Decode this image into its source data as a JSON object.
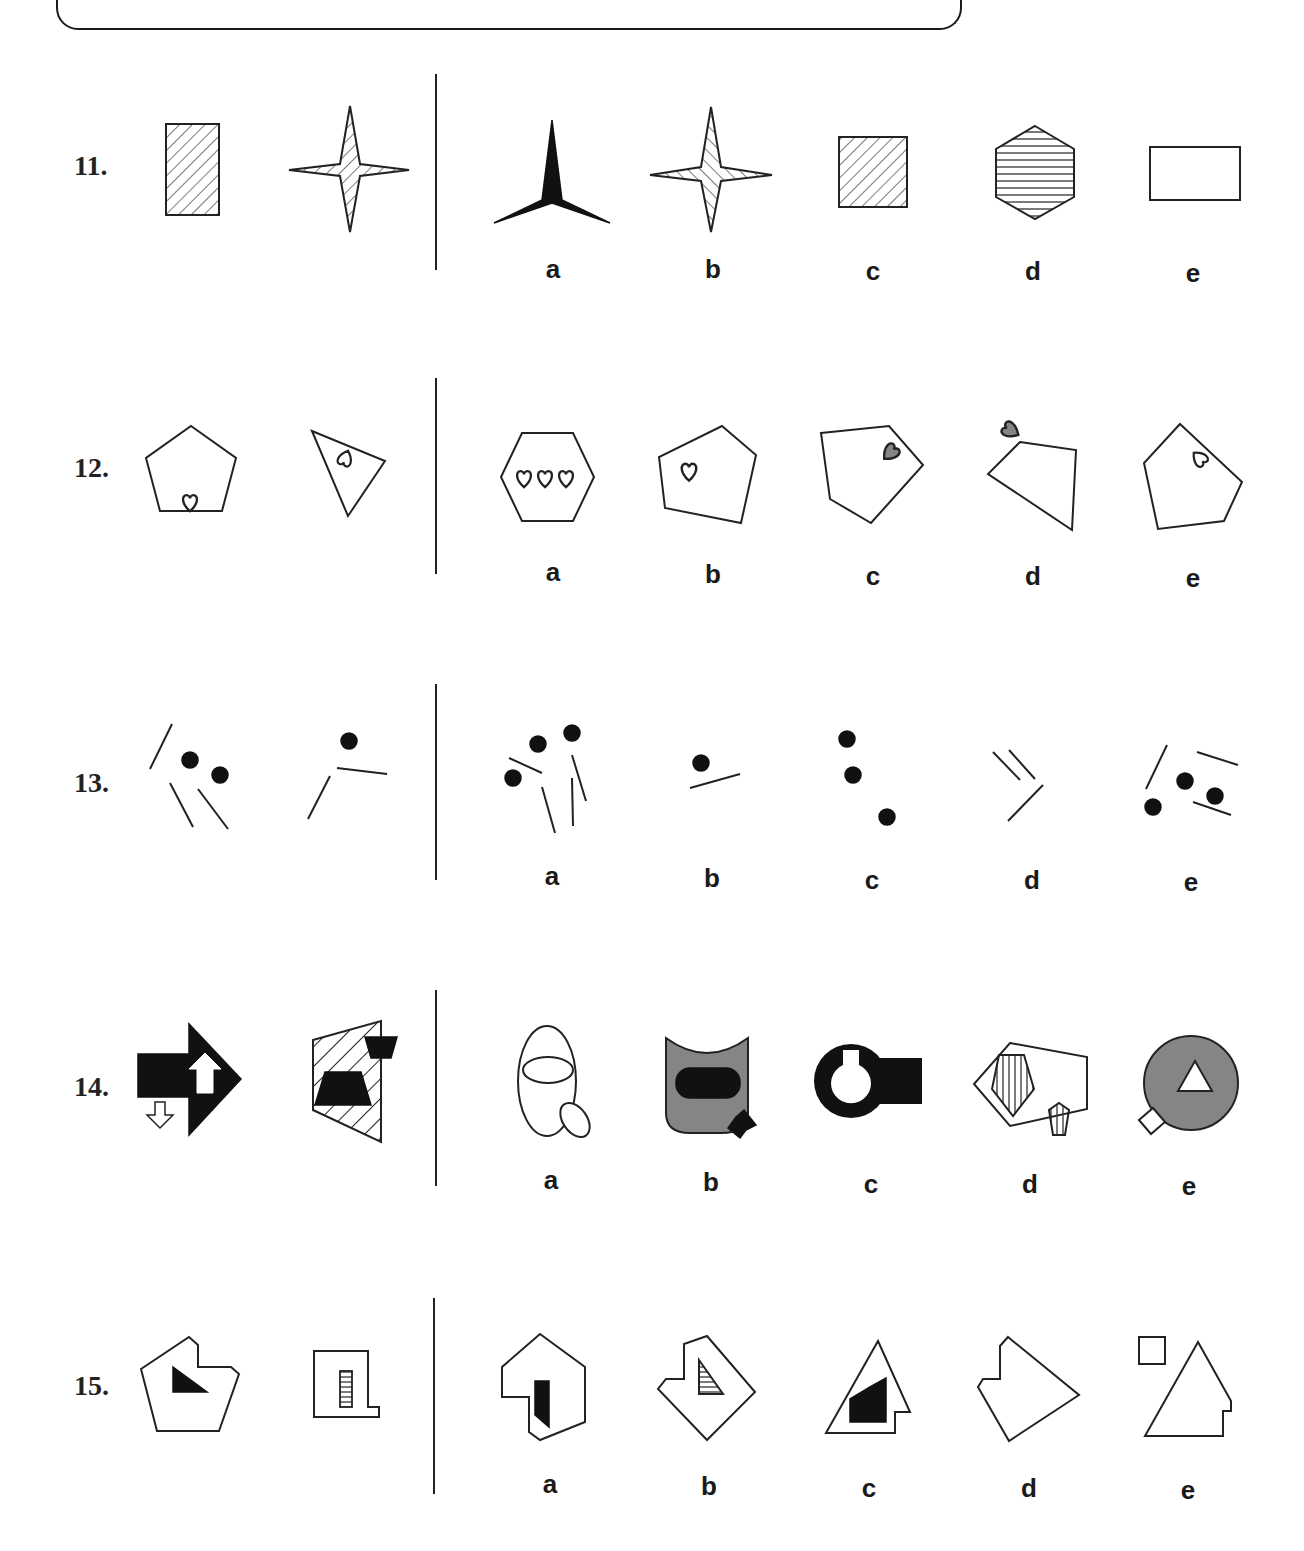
{
  "page": {
    "header_box": "rounded-bottom border panel (content cropped)"
  },
  "questions": [
    {
      "number": "11.",
      "given": [
        "hatched-rectangle",
        "hatched-four-point-star"
      ],
      "options": [
        {
          "label": "a",
          "figure": "black-three-point-star"
        },
        {
          "label": "b",
          "figure": "hatched-four-point-star"
        },
        {
          "label": "c",
          "figure": "hatched-square"
        },
        {
          "label": "d",
          "figure": "horizontal-striped-hexagon"
        },
        {
          "label": "e",
          "figure": "empty-rectangle"
        }
      ]
    },
    {
      "number": "12.",
      "given": [
        "pentagon-with-heart-on-edge",
        "triangle-with-heart-on-edge"
      ],
      "options": [
        {
          "label": "a",
          "figure": "hexagon-with-three-hearts"
        },
        {
          "label": "b",
          "figure": "pentagon-with-heart-inside"
        },
        {
          "label": "c",
          "figure": "pentagon-with-grey-heart-on-edge"
        },
        {
          "label": "d",
          "figure": "quadrilateral-with-grey-heart-outside"
        },
        {
          "label": "e",
          "figure": "pentagon-with-heart-on-edge"
        }
      ]
    },
    {
      "number": "13.",
      "given": [
        "three-lines-two-dots",
        "two-lines-one-dot"
      ],
      "options": [
        {
          "label": "a",
          "figure": "four-lines-three-dots"
        },
        {
          "label": "b",
          "figure": "one-line-one-dot"
        },
        {
          "label": "c",
          "figure": "three-dots"
        },
        {
          "label": "d",
          "figure": "three-lines"
        },
        {
          "label": "e",
          "figure": "three-lines-three-dots"
        }
      ]
    },
    {
      "number": "14.",
      "given": [
        "black-arrow-with-white-arrows",
        "hatched-quad-with-black-trapezoids"
      ],
      "options": [
        {
          "label": "a",
          "figure": "ellipse-with-ellipses"
        },
        {
          "label": "b",
          "figure": "grey-shield-with-black-rounded-rect"
        },
        {
          "label": "c",
          "figure": "black-ring-with-rectangle"
        },
        {
          "label": "d",
          "figure": "hexagon-with-striped-pentagons"
        },
        {
          "label": "e",
          "figure": "grey-circle-with-white-triangle"
        }
      ]
    },
    {
      "number": "15.",
      "given": [
        "notched-pentagon-with-black-triangle",
        "notched-rectangle-with-striped-bar"
      ],
      "options": [
        {
          "label": "a",
          "figure": "notched-hexagon-with-black-quad"
        },
        {
          "label": "b",
          "figure": "notched-diamond-with-striped-triangle"
        },
        {
          "label": "c",
          "figure": "notched-triangle-with-black-quad"
        },
        {
          "label": "d",
          "figure": "notched-diamond"
        },
        {
          "label": "e",
          "figure": "notched-triangle-with-separate-rectangle"
        }
      ]
    }
  ]
}
